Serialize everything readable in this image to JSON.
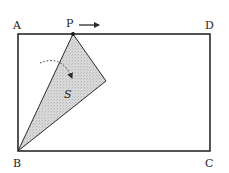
{
  "diagram": {
    "type": "geometry",
    "colors": {
      "stroke": "#2a2a2a",
      "shade": "#d4d4d4",
      "text": "#222222",
      "background": "#ffffff"
    },
    "rectangle": {
      "vertices": {
        "A": {
          "label": "A"
        },
        "B": {
          "label": "B"
        },
        "C": {
          "label": "C"
        },
        "D": {
          "label": "D"
        }
      }
    },
    "moving_point": {
      "label": "P",
      "direction": "right",
      "on_side": "AD"
    },
    "shaded_region": {
      "label": "S",
      "description": "shaded triangle with vertices B and P"
    },
    "rotation_arrow": {
      "style": "dotted curved arrow",
      "direction": "clockwise"
    }
  }
}
